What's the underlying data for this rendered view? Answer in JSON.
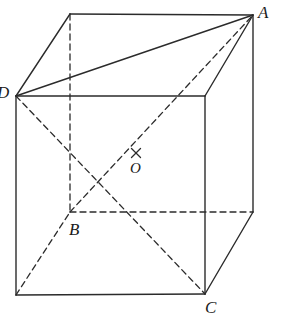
{
  "figure": {
    "type": "geometry-diagram",
    "width": 281,
    "height": 328,
    "background_color": "#ffffff",
    "line_color": "#2b2b2b",
    "dash_color": "#2b2b2b",
    "solid_stroke_width": 1.4,
    "dashed_stroke_width": 1.3,
    "dash_pattern": "6,4"
  },
  "vertices": {
    "front_top_left": {
      "name": "D",
      "x": 16,
      "y": 96,
      "hidden": false
    },
    "front_top_right": {
      "name": "",
      "x": 205,
      "y": 96,
      "hidden": false
    },
    "front_bottom_right": {
      "name": "C",
      "x": 205,
      "y": 294,
      "hidden": false
    },
    "front_bottom_left": {
      "name": "",
      "x": 16,
      "y": 295,
      "hidden": false
    },
    "back_top_left": {
      "name": "",
      "x": 70,
      "y": 14,
      "hidden": false
    },
    "back_top_right": {
      "name": "A",
      "x": 253,
      "y": 15,
      "hidden": false
    },
    "back_bottom_right": {
      "name": "",
      "x": 253,
      "y": 212,
      "hidden": false
    },
    "back_bottom_left": {
      "name": "B",
      "x": 70,
      "y": 212,
      "hidden": true
    },
    "center": {
      "name": "O",
      "x": 136,
      "y": 156,
      "hidden": false
    }
  },
  "labels": [
    {
      "id": "label-A",
      "text": "A",
      "x": 258,
      "y": 4,
      "size": "normal"
    },
    {
      "id": "label-B",
      "text": "B",
      "x": 69,
      "y": 221,
      "size": "normal"
    },
    {
      "id": "label-C",
      "text": "C",
      "x": 205,
      "y": 299,
      "size": "normal"
    },
    {
      "id": "label-D",
      "text": "D",
      "x": -3,
      "y": 84,
      "size": "normal"
    },
    {
      "id": "label-O",
      "text": "O",
      "x": 130,
      "y": 161,
      "size": "small"
    }
  ],
  "solid_edges": [
    {
      "id": "front-top",
      "from": "front_top_left",
      "to": "front_top_right"
    },
    {
      "id": "front-right",
      "from": "front_top_right",
      "to": "front_bottom_right"
    },
    {
      "id": "front-bottom",
      "from": "front_bottom_right",
      "to": "front_bottom_left"
    },
    {
      "id": "front-left",
      "from": "front_bottom_left",
      "to": "front_top_left"
    },
    {
      "id": "top-back",
      "from": "back_top_left",
      "to": "back_top_right"
    },
    {
      "id": "top-left-slant",
      "from": "front_top_left",
      "to": "back_top_left"
    },
    {
      "id": "top-right-slant",
      "from": "front_top_right",
      "to": "back_top_right"
    },
    {
      "id": "back-right-vertical",
      "from": "back_top_right",
      "to": "back_bottom_right"
    },
    {
      "id": "bottom-right-slant",
      "from": "back_bottom_right",
      "to": "front_bottom_right"
    },
    {
      "id": "diagonal-D-A",
      "from": "front_top_left",
      "to": "back_top_right"
    }
  ],
  "dashed_edges": [
    {
      "id": "back-left-vertical",
      "from": "back_top_left",
      "to": "back_bottom_left"
    },
    {
      "id": "back-bottom",
      "from": "back_bottom_left",
      "to": "back_bottom_right"
    },
    {
      "id": "bottom-left-slant",
      "from": "front_bottom_left",
      "to": "back_bottom_left"
    },
    {
      "id": "space-diagonal-D-C-via-O",
      "from": "front_top_left",
      "to": "front_bottom_right"
    },
    {
      "id": "space-diagonal-B-A-via-O",
      "from": "back_bottom_left",
      "to": "back_top_right"
    }
  ],
  "markers": {
    "center_cross": {
      "id": "center-cross-mark",
      "x": 136,
      "y": 153,
      "arm": 4.5
    }
  }
}
